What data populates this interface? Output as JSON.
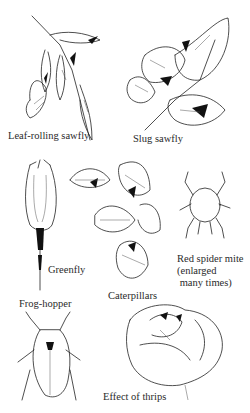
{
  "plate": {
    "style": "pen-and-ink botanical illustration",
    "background": "#ffffff",
    "ink_color": "#222222"
  },
  "illustrations": [
    {
      "id": "leaf-rolling-sawfly",
      "label": "Leaf-rolling sawfly",
      "subject": "rolled rose leaves"
    },
    {
      "id": "slug-sawfly",
      "label": "Slug sawfly",
      "subject": "skeletonised rose leaves"
    },
    {
      "id": "greenfly",
      "label": "Greenfly",
      "subject": "rose bud with aphids on stem"
    },
    {
      "id": "caterpillars",
      "label": "Caterpillars",
      "subject": "eaten rose leaves"
    },
    {
      "id": "red-spider-mite",
      "label": "Red spider mite\n(enlarged\n many times)",
      "subject": "mite, enlarged"
    },
    {
      "id": "frog-hopper",
      "label": "Frog-hopper",
      "subject": "insect, top view"
    },
    {
      "id": "effect-of-thrips",
      "label": "Effect of thrips",
      "subject": "damaged rose bloom"
    }
  ]
}
